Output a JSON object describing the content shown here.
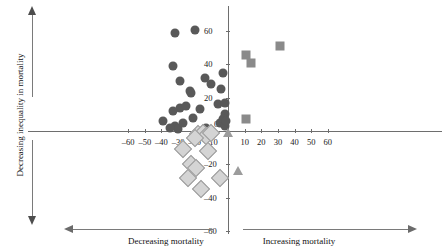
{
  "chart_data": {
    "type": "scatter",
    "title": "",
    "xlabel": "",
    "ylabel": "Decreasing inequality in mortality",
    "xlim": [
      -60,
      60
    ],
    "ylim": [
      -60,
      60
    ],
    "grid": false,
    "legend": "none",
    "x_ticks": [
      -60,
      -50,
      -40,
      -30,
      -20,
      -10,
      0,
      10,
      20,
      30,
      40,
      50,
      60
    ],
    "x_tick_labels": [
      "–60",
      "–50",
      "–40",
      "–30",
      "–20",
      "–10",
      "0",
      "10",
      "20",
      "30",
      "40",
      "50",
      "60"
    ],
    "y_ticks": [
      -60,
      -40,
      -20,
      0,
      20,
      40,
      60
    ],
    "y_tick_labels": [
      "–60",
      "–40",
      "–20",
      "0",
      "20",
      "40",
      "60"
    ],
    "annotations": {
      "y_axis_arrow_label": "Decreasing inequality in mortality",
      "x_axis_left_label": "Decreasing mortality",
      "x_axis_right_label": "Increasing mortality"
    },
    "colors": {
      "circle": "#595959",
      "diamond_fill": "#d4d4d4",
      "diamond_edge": "#9a9a9a",
      "square": "#8a8a8a",
      "triangle": "#9c9c9c",
      "axis": "#6e6e6e",
      "annotation_arrow": "#7a7a7a",
      "text": "#111111"
    },
    "series": [
      {
        "name": "circles",
        "marker": "circle",
        "points": [
          [
            -32,
            59
          ],
          [
            -20,
            61
          ],
          [
            -33,
            39
          ],
          [
            -29,
            30
          ],
          [
            -23,
            24
          ],
          [
            -22,
            23
          ],
          [
            -14,
            32
          ],
          [
            -10,
            28
          ],
          [
            -4,
            25
          ],
          [
            -3,
            35
          ],
          [
            -29,
            14
          ],
          [
            -25,
            15
          ],
          [
            -33,
            12
          ],
          [
            -17,
            13
          ],
          [
            -6,
            16
          ],
          [
            -2,
            10
          ],
          [
            -39,
            6
          ],
          [
            -32,
            3
          ],
          [
            -30,
            1
          ],
          [
            -27,
            5
          ],
          [
            -5,
            5
          ],
          [
            -3,
            7
          ],
          [
            -2,
            3
          ],
          [
            -1,
            6
          ],
          [
            -13,
            2
          ],
          [
            -21,
            8
          ],
          [
            -35,
            2
          ],
          [
            -2,
            17
          ]
        ]
      },
      {
        "name": "diamonds",
        "marker": "diamond",
        "points": [
          [
            -18,
            -2
          ],
          [
            -15,
            -1
          ],
          [
            -13,
            -3
          ],
          [
            -27,
            -11
          ],
          [
            -12,
            -12
          ],
          [
            -22,
            -20
          ],
          [
            -19,
            -22
          ],
          [
            -24,
            -28
          ],
          [
            -5,
            -28
          ],
          [
            -16,
            -35
          ],
          [
            -10,
            -1
          ],
          [
            -20,
            -4
          ]
        ]
      },
      {
        "name": "squares",
        "marker": "square",
        "points": [
          [
            11,
            46
          ],
          [
            14,
            41
          ],
          [
            31,
            51
          ],
          [
            11,
            7
          ]
        ]
      },
      {
        "name": "triangles",
        "marker": "triangle",
        "points": [
          [
            0,
            -1
          ],
          [
            6,
            -24
          ]
        ]
      }
    ]
  }
}
